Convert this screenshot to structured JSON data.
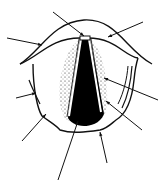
{
  "diagram": {
    "title": "",
    "stroke_color": "#111111",
    "fill_dark": "#000000",
    "background": "#ffffff",
    "arrows": [
      {
        "id": "arrow-1",
        "x1": 53,
        "y1": 12,
        "x2": 84,
        "y2": 36
      },
      {
        "id": "arrow-2",
        "x1": 143,
        "y1": 22,
        "x2": 108,
        "y2": 37
      },
      {
        "id": "arrow-3",
        "x1": 7,
        "y1": 38,
        "x2": 42,
        "y2": 45
      },
      {
        "id": "arrow-4",
        "x1": 158,
        "y1": 100,
        "x2": 104,
        "y2": 78
      },
      {
        "id": "arrow-5",
        "x1": 16,
        "y1": 98,
        "x2": 36,
        "y2": 93
      },
      {
        "id": "arrow-6",
        "x1": 22,
        "y1": 141,
        "x2": 46,
        "y2": 114
      },
      {
        "id": "arrow-7",
        "x1": 58,
        "y1": 180,
        "x2": 78,
        "y2": 121
      },
      {
        "id": "arrow-8",
        "x1": 107,
        "y1": 163,
        "x2": 100,
        "y2": 132
      },
      {
        "id": "arrow-9",
        "x1": 142,
        "y1": 130,
        "x2": 106,
        "y2": 101
      }
    ]
  }
}
